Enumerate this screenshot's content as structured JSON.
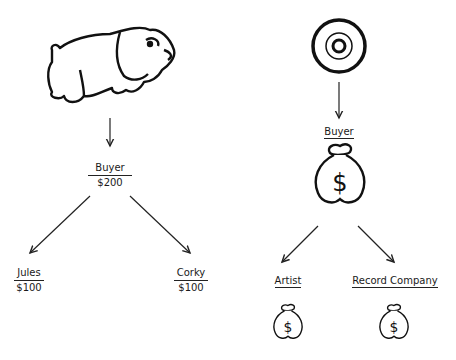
{
  "left_diagram": {
    "source_icon": "bulldog-icon",
    "buyer": {
      "label": "Buyer",
      "amount": "$200"
    },
    "recipients": [
      {
        "label": "Jules",
        "amount": "$100"
      },
      {
        "label": "Corky",
        "amount": "$100"
      }
    ]
  },
  "right_diagram": {
    "source_icon": "record-disc-icon",
    "buyer": {
      "label": "Buyer",
      "icon": "money-bag-icon"
    },
    "recipients": [
      {
        "label": "Artist",
        "icon": "money-bag-icon"
      },
      {
        "label": "Record Company",
        "icon": "money-bag-icon"
      }
    ]
  },
  "colors": {
    "ink": "#1a1a1a",
    "background": "#ffffff"
  }
}
